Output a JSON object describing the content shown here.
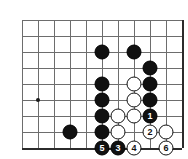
{
  "diagram": {
    "type": "go-board-diagram",
    "board": {
      "columns": 11,
      "rows": 9,
      "cell_size": 16,
      "origin_x": 22,
      "origin_y": 20,
      "line_color": "#6d6d6d",
      "edge_color": "#2b2b2b",
      "background": "#ffffff"
    },
    "star_points": [
      {
        "name": "hoshi-marker",
        "col": 1,
        "row": 5
      }
    ],
    "stones": [
      {
        "name": "black-stone",
        "color": "black",
        "col": 5,
        "row": 2,
        "label": ""
      },
      {
        "name": "black-stone",
        "color": "black",
        "col": 7,
        "row": 2,
        "label": ""
      },
      {
        "name": "black-stone",
        "color": "black",
        "col": 8,
        "row": 3,
        "label": ""
      },
      {
        "name": "black-stone",
        "color": "black",
        "col": 5,
        "row": 4,
        "label": ""
      },
      {
        "name": "black-stone",
        "color": "black",
        "col": 8,
        "row": 4,
        "label": ""
      },
      {
        "name": "black-stone",
        "color": "black",
        "col": 5,
        "row": 5,
        "label": ""
      },
      {
        "name": "black-stone",
        "color": "black",
        "col": 8,
        "row": 5,
        "label": ""
      },
      {
        "name": "black-stone",
        "color": "black",
        "col": 5,
        "row": 6,
        "label": ""
      },
      {
        "name": "black-stone",
        "color": "black",
        "col": 5,
        "row": 7,
        "label": ""
      },
      {
        "name": "black-stone",
        "color": "black",
        "col": 3,
        "row": 7,
        "label": ""
      },
      {
        "name": "white-stone",
        "color": "white",
        "col": 7,
        "row": 4,
        "label": ""
      },
      {
        "name": "white-stone",
        "color": "white",
        "col": 7,
        "row": 5,
        "label": ""
      },
      {
        "name": "white-stone",
        "color": "white",
        "col": 6,
        "row": 6,
        "label": ""
      },
      {
        "name": "white-stone",
        "color": "white",
        "col": 7,
        "row": 6,
        "label": ""
      },
      {
        "name": "white-stone",
        "color": "white",
        "col": 6,
        "row": 7,
        "label": ""
      },
      {
        "name": "white-stone",
        "color": "white",
        "col": 9,
        "row": 7,
        "label": ""
      },
      {
        "name": "move-stone-1",
        "color": "black",
        "col": 8,
        "row": 6,
        "label": "1"
      },
      {
        "name": "move-stone-2",
        "color": "white",
        "col": 8,
        "row": 7,
        "label": "2"
      },
      {
        "name": "move-stone-3",
        "color": "black",
        "col": 6,
        "row": 8,
        "label": "3"
      },
      {
        "name": "move-stone-4",
        "color": "white",
        "col": 7,
        "row": 8,
        "label": "4"
      },
      {
        "name": "move-stone-5",
        "color": "black",
        "col": 5,
        "row": 8,
        "label": "5"
      },
      {
        "name": "move-stone-6",
        "color": "white",
        "col": 9,
        "row": 8,
        "label": "6"
      }
    ]
  }
}
